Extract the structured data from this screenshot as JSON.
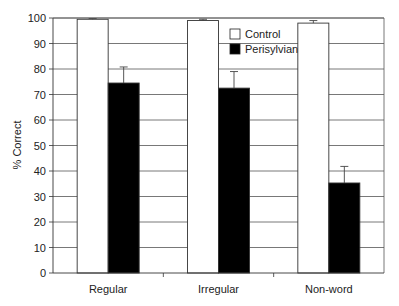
{
  "chart_data": {
    "type": "bar",
    "title": "",
    "xlabel": "",
    "ylabel": "% Correct",
    "ylim": [
      0,
      100
    ],
    "yticks": [
      0,
      10,
      20,
      30,
      40,
      50,
      60,
      70,
      80,
      90,
      100
    ],
    "grid": true,
    "legend_position": "top-center-inside",
    "categories": [
      "Regular",
      "Irregular",
      "Non-word"
    ],
    "series": [
      {
        "name": "Control",
        "color": "#ffffff",
        "values": [
          99.5,
          99,
          98
        ],
        "error": [
          0.3,
          0.5,
          1
        ]
      },
      {
        "name": "Perisylvian",
        "color": "#000000",
        "values": [
          74.5,
          72.5,
          35.3
        ],
        "error": [
          6.3,
          6.5,
          6.5
        ]
      }
    ]
  },
  "legend": {
    "items": [
      "Control",
      "Perisylvian"
    ]
  }
}
